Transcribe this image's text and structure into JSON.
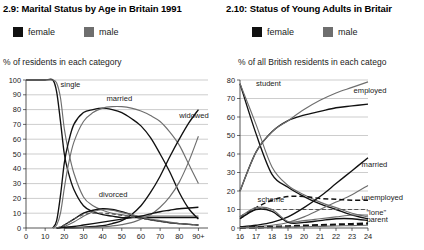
{
  "left": {
    "title": "2.9: Marital Status by Age in Britain 1991",
    "legend": [
      {
        "label": "female",
        "color": "#111111",
        "key": "female"
      },
      {
        "label": "male",
        "color": "#6e6e6e",
        "key": "male"
      }
    ],
    "axis_caption": "% of residents in each category"
  },
  "right": {
    "title": "2.10: Status of Young Adults in Britair",
    "legend": [
      {
        "label": "female",
        "color": "#111111",
        "key": "female"
      },
      {
        "label": "male",
        "color": "#6e6e6e",
        "key": "male"
      }
    ],
    "axis_caption": "% of all British residents in each catego"
  },
  "chart_data": [
    {
      "id": "marital-status",
      "type": "line",
      "title": "2.9: Marital Status by Age in Britain 1991",
      "xlabel": "",
      "ylabel": "% of residents in each category",
      "xlim": [
        0,
        95
      ],
      "ylim": [
        0,
        100
      ],
      "grid": true,
      "legend": [
        "female",
        "male"
      ],
      "legend_position": "top",
      "xticks": [
        "0",
        "10",
        "20",
        "30",
        "40",
        "50",
        "60",
        "70",
        "80",
        "90+"
      ],
      "xtick_values": [
        0,
        10,
        20,
        30,
        40,
        50,
        60,
        70,
        80,
        90
      ],
      "yticks": [
        0,
        10,
        20,
        30,
        40,
        50,
        60,
        70,
        80,
        90,
        100
      ],
      "annotations": [
        {
          "text": "single",
          "x": 18,
          "y": 95
        },
        {
          "text": "married",
          "x": 42,
          "y": 86
        },
        {
          "text": "widowed",
          "x": 80,
          "y": 74
        },
        {
          "text": "divorced",
          "x": 38,
          "y": 21
        }
      ],
      "series": [
        {
          "name": "single female",
          "category": "single",
          "sex": "female",
          "style": "solid",
          "x": [
            0,
            5,
            10,
            14,
            16,
            18,
            20,
            22,
            25,
            30,
            35,
            40,
            45,
            50,
            55,
            60,
            65,
            70,
            75,
            80,
            85,
            90
          ],
          "values": [
            100,
            100,
            100,
            100,
            92,
            72,
            50,
            38,
            26,
            15,
            11,
            9,
            8,
            7,
            7,
            7,
            7,
            7,
            7,
            7,
            7,
            7
          ]
        },
        {
          "name": "single male",
          "category": "single",
          "sex": "male",
          "style": "solid",
          "x": [
            0,
            5,
            10,
            14,
            16,
            18,
            20,
            22,
            25,
            30,
            35,
            40,
            45,
            50,
            55,
            60,
            65,
            70,
            75,
            80,
            85,
            90
          ],
          "values": [
            100,
            100,
            100,
            100,
            98,
            88,
            67,
            53,
            37,
            21,
            15,
            12,
            10,
            9,
            8,
            8,
            8,
            8,
            8,
            8,
            8,
            8
          ]
        },
        {
          "name": "married female",
          "category": "married",
          "sex": "female",
          "style": "solid",
          "x": [
            14,
            16,
            18,
            20,
            22,
            25,
            30,
            35,
            40,
            45,
            50,
            55,
            60,
            65,
            70,
            75,
            80,
            85,
            90
          ],
          "values": [
            0,
            5,
            22,
            44,
            57,
            70,
            78,
            80,
            81,
            80,
            78,
            74,
            69,
            61,
            50,
            38,
            24,
            13,
            6
          ]
        },
        {
          "name": "married male",
          "category": "married",
          "sex": "male",
          "style": "solid",
          "x": [
            14,
            16,
            18,
            20,
            22,
            25,
            30,
            35,
            40,
            45,
            50,
            55,
            60,
            65,
            70,
            75,
            80,
            85,
            90
          ],
          "values": [
            0,
            2,
            10,
            27,
            42,
            58,
            72,
            78,
            81,
            82,
            82,
            81,
            79,
            76,
            72,
            65,
            56,
            43,
            30
          ]
        },
        {
          "name": "widowed female",
          "category": "widowed",
          "sex": "female",
          "style": "solid",
          "x": [
            20,
            30,
            40,
            45,
            50,
            55,
            60,
            65,
            70,
            75,
            80,
            85,
            90
          ],
          "values": [
            0,
            0.5,
            1.5,
            3,
            5,
            9,
            15,
            24,
            35,
            48,
            60,
            71,
            80
          ]
        },
        {
          "name": "widowed male",
          "category": "widowed",
          "sex": "male",
          "style": "solid",
          "x": [
            20,
            30,
            40,
            45,
            50,
            55,
            60,
            65,
            70,
            75,
            80,
            85,
            90
          ],
          "values": [
            0,
            0.3,
            0.8,
            1.4,
            2.3,
            3.6,
            6,
            9,
            14,
            21,
            31,
            45,
            62
          ]
        },
        {
          "name": "divorced female",
          "category": "divorced",
          "sex": "female",
          "style": "solid",
          "x": [
            16,
            18,
            20,
            25,
            30,
            35,
            40,
            45,
            50,
            55,
            60,
            65,
            70,
            75,
            80,
            85,
            90
          ],
          "values": [
            0,
            0.5,
            2,
            6,
            10,
            12,
            13,
            12.5,
            11,
            9,
            7,
            5.5,
            4.5,
            3.5,
            3,
            2.5,
            2
          ]
        },
        {
          "name": "divorced male",
          "category": "divorced",
          "sex": "male",
          "style": "solid",
          "x": [
            16,
            18,
            20,
            25,
            30,
            35,
            40,
            45,
            50,
            55,
            60,
            65,
            70,
            75,
            80,
            85,
            90
          ],
          "values": [
            0,
            0.3,
            1,
            4,
            8,
            11,
            12.5,
            12,
            10.5,
            9,
            7.5,
            6,
            5,
            4,
            3,
            2.5,
            2
          ]
        },
        {
          "name": "other female",
          "category": "other",
          "sex": "female",
          "style": "solid",
          "x": [
            16,
            20,
            25,
            30,
            35,
            40,
            45,
            50,
            55,
            60,
            65,
            70,
            75,
            80,
            85,
            90
          ],
          "values": [
            0,
            0.5,
            1,
            2,
            3,
            4,
            5,
            6,
            7,
            8,
            9.5,
            11,
            12,
            13,
            13.5,
            14
          ]
        },
        {
          "name": "other male dashed",
          "category": "other",
          "sex": "male",
          "style": "dashed",
          "x": [
            16,
            20,
            25,
            30,
            35,
            40,
            45,
            50,
            55,
            60,
            65,
            70,
            75,
            80,
            85,
            90
          ],
          "values": [
            0,
            2,
            6,
            9,
            10,
            10,
            9.5,
            8.5,
            7.5,
            6.5,
            5.5,
            4.5,
            3.5,
            3,
            2.5,
            2
          ]
        }
      ]
    },
    {
      "id": "young-adult-status",
      "type": "line",
      "title": "2.10: Status of Young Adults in Britair",
      "xlabel": "",
      "ylabel": "% of all British residents in each catego",
      "xlim": [
        16,
        24
      ],
      "ylim": [
        0,
        80
      ],
      "grid": true,
      "legend": [
        "female",
        "male"
      ],
      "legend_position": "top",
      "xticks": [
        "16",
        "17",
        "18",
        "19",
        "20",
        "21",
        "22",
        "23",
        "24"
      ],
      "xtick_values": [
        16,
        17,
        18,
        19,
        20,
        21,
        22,
        23,
        24
      ],
      "yticks": [
        0,
        10,
        20,
        30,
        40,
        50,
        60,
        70,
        80
      ],
      "annotations": [
        {
          "text": "student",
          "x": 17.0,
          "y": 77
        },
        {
          "text": "employed",
          "x": 23.1,
          "y": 73
        },
        {
          "text": "married",
          "x": 23.6,
          "y": 33
        },
        {
          "text": "unemployed",
          "x": 23.6,
          "y": 15
        },
        {
          "text": "\"lone\"",
          "x": 23.9,
          "y": 7
        },
        {
          "text": "parent",
          "x": 23.9,
          "y": 3
        },
        {
          "text": "scheme",
          "x": 17.1,
          "y": 14
        }
      ],
      "series": [
        {
          "name": "student female",
          "category": "student",
          "sex": "female",
          "style": "solid",
          "x": [
            16,
            17,
            18,
            19,
            20,
            21,
            22,
            23,
            24
          ],
          "values": [
            78,
            51,
            29,
            22,
            17,
            13,
            10,
            7,
            5
          ]
        },
        {
          "name": "student male",
          "category": "student",
          "sex": "male",
          "style": "solid",
          "x": [
            16,
            17,
            18,
            19,
            20,
            21,
            22,
            23,
            24
          ],
          "values": [
            78,
            56,
            33,
            23,
            18,
            14,
            11,
            8,
            6
          ]
        },
        {
          "name": "employed female",
          "category": "employed",
          "sex": "female",
          "style": "solid",
          "x": [
            16,
            17,
            18,
            19,
            20,
            21,
            22,
            23,
            24
          ],
          "values": [
            20,
            41,
            52,
            58,
            61,
            63,
            65,
            66,
            67
          ]
        },
        {
          "name": "employed male",
          "category": "employed",
          "sex": "male",
          "style": "solid",
          "x": [
            16,
            17,
            18,
            19,
            20,
            21,
            22,
            23,
            24
          ],
          "values": [
            20,
            41,
            52,
            58,
            64,
            69,
            73,
            76,
            79
          ]
        },
        {
          "name": "married female",
          "category": "married",
          "sex": "female",
          "style": "solid",
          "x": [
            16,
            17,
            18,
            19,
            20,
            21,
            22,
            23,
            24
          ],
          "values": [
            0.5,
            1.5,
            3,
            6,
            11,
            17,
            24,
            31,
            38
          ]
        },
        {
          "name": "married male",
          "category": "married",
          "sex": "male",
          "style": "solid",
          "x": [
            16,
            17,
            18,
            19,
            20,
            21,
            22,
            23,
            24
          ],
          "values": [
            0.3,
            0.8,
            1.5,
            3,
            6,
            10,
            14,
            18,
            23
          ]
        },
        {
          "name": "unemployed female",
          "category": "unemployed",
          "sex": "female",
          "style": "dashed",
          "x": [
            16,
            17,
            18,
            19,
            20,
            21,
            22,
            23,
            24
          ],
          "values": [
            6,
            11,
            15,
            17,
            17,
            16,
            15.5,
            15,
            15
          ]
        },
        {
          "name": "unemployed male",
          "category": "unemployed",
          "sex": "male",
          "style": "dashed",
          "x": [
            16,
            17,
            18,
            19,
            20,
            21,
            22,
            23,
            24
          ],
          "values": [
            5,
            10,
            10,
            10,
            10,
            10,
            10,
            10,
            10
          ]
        },
        {
          "name": "scheme female",
          "category": "scheme",
          "sex": "female",
          "style": "solid",
          "x": [
            16,
            17,
            18,
            19,
            20,
            21,
            22,
            23,
            24
          ],
          "values": [
            5,
            10,
            9,
            3,
            3,
            4,
            5,
            5,
            4
          ]
        },
        {
          "name": "scheme male",
          "category": "scheme",
          "sex": "male",
          "style": "solid",
          "x": [
            16,
            17,
            18,
            19,
            20,
            21,
            22,
            23,
            24
          ],
          "values": [
            6,
            11,
            10,
            3.5,
            4,
            5,
            6,
            7,
            7
          ]
        },
        {
          "name": "lone parent female",
          "category": "lone parent",
          "sex": "female",
          "style": "thick-dashed",
          "x": [
            16,
            17,
            18,
            19,
            20,
            21,
            22,
            23,
            24
          ],
          "values": [
            0.3,
            0.4,
            0.6,
            0.9,
            1.2,
            1.5,
            1.8,
            2.1,
            2.4
          ]
        },
        {
          "name": "lone parent male",
          "category": "lone parent",
          "sex": "male",
          "style": "solid",
          "x": [
            16,
            17,
            18,
            19,
            20,
            21,
            22,
            23,
            24
          ],
          "values": [
            0.2,
            0.3,
            0.4,
            0.5,
            0.7,
            0.9,
            1.1,
            1.3,
            1.5
          ]
        }
      ]
    }
  ]
}
